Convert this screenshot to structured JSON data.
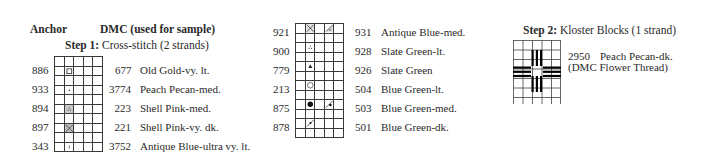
{
  "header": {
    "anchor_label": "Anchor",
    "dmc_label": "DMC (used for sample)"
  },
  "step1": {
    "prefix": "Step 1:",
    "text": "Cross-stitch (2 strands)"
  },
  "step2": {
    "prefix": "Step 2:",
    "text": "Kloster Blocks (1 strand)",
    "anchor": "2950",
    "name": "Peach Pecan-dk.",
    "note": "(DMC Flower Thread)"
  },
  "left_key": [
    {
      "anchor": "886",
      "dmc": "677",
      "name": "Old Gold-vy. lt.",
      "symbol": "open-square"
    },
    {
      "anchor": "933",
      "dmc": "3774",
      "name": "Peach Pecan-med.",
      "symbol": "dot"
    },
    {
      "anchor": "894",
      "dmc": "223",
      "name": "Shell Pink-med.",
      "symbol": "shaded-dots"
    },
    {
      "anchor": "897",
      "dmc": "221",
      "name": "Shell Pink-vy. dk.",
      "symbol": "shaded-x"
    },
    {
      "anchor": "343",
      "dmc": "3752",
      "name": "Antique Blue-ultra vy. lt.",
      "symbol": "tick"
    }
  ],
  "middle_key": [
    {
      "anchor": "921",
      "dmc": "931",
      "name": "Antique Blue-med.",
      "symbol": "x-and-half-triangle"
    },
    {
      "anchor": "900",
      "dmc": "928",
      "name": "Slate Green-lt.",
      "symbol": "three-dots"
    },
    {
      "anchor": "779",
      "dmc": "926",
      "name": "Slate Green",
      "symbol": "filled-triangle"
    },
    {
      "anchor": "213",
      "dmc": "504",
      "name": "Blue Green-lt.",
      "symbol": "open-circle"
    },
    {
      "anchor": "875",
      "dmc": "503",
      "name": "Blue Green-med.",
      "symbol": "filled-circle-and-half"
    },
    {
      "anchor": "878",
      "dmc": "501",
      "name": "Blue Green-dk.",
      "symbol": "diagonal-dot"
    }
  ]
}
